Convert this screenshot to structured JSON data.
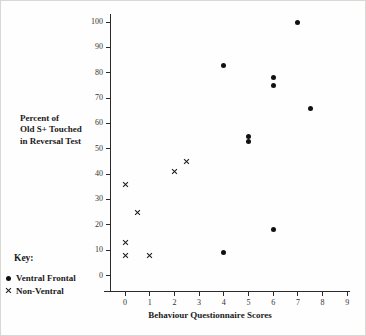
{
  "chart_data": {
    "type": "scatter",
    "title": "",
    "xlabel": "Behaviour Questionnaire Scores",
    "ylabel": "Percent of\nOld S+ Touched\nin Reversal Test",
    "xlim": [
      0,
      9
    ],
    "ylim": [
      0,
      100
    ],
    "x_ticks": [
      0,
      1,
      2,
      3,
      4,
      5,
      6,
      7,
      8,
      9
    ],
    "y_ticks": [
      0,
      10,
      20,
      30,
      40,
      50,
      60,
      70,
      80,
      90,
      100
    ],
    "grid": false,
    "legend": {
      "title": "Key:",
      "position": "bottom-left",
      "entries": [
        {
          "marker": "filled-circle",
          "label": "Ventral Frontal"
        },
        {
          "marker": "x-cross",
          "label": "Non-Ventral"
        }
      ]
    },
    "series": [
      {
        "name": "Ventral Frontal",
        "marker": "filled-circle",
        "points": [
          [
            7,
            100
          ],
          [
            4,
            83
          ],
          [
            6,
            78
          ],
          [
            6,
            75
          ],
          [
            7.5,
            66
          ],
          [
            5,
            55
          ],
          [
            5,
            53
          ],
          [
            6,
            18
          ],
          [
            4,
            9
          ]
        ]
      },
      {
        "name": "Non-Ventral",
        "marker": "x-cross",
        "points": [
          [
            2.5,
            45
          ],
          [
            2,
            41
          ],
          [
            0,
            36
          ],
          [
            0.5,
            25
          ],
          [
            0,
            13
          ],
          [
            0,
            8
          ],
          [
            1,
            8
          ]
        ]
      }
    ],
    "colors": {
      "ink": "#1c1c1c",
      "background": "#ffffff"
    }
  }
}
